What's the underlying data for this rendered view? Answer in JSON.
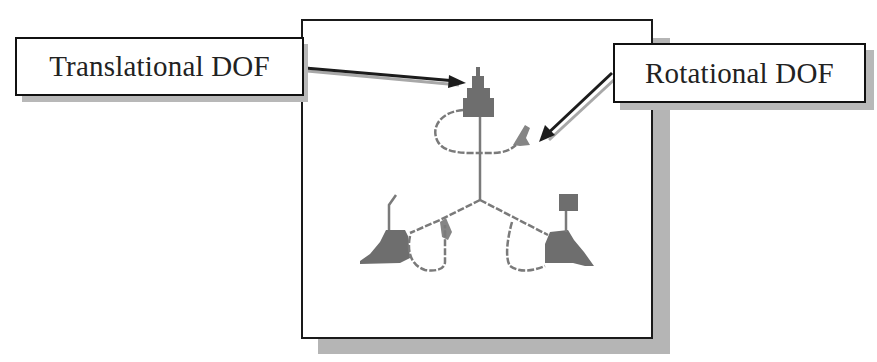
{
  "figure": {
    "callouts": [
      {
        "id": "translational",
        "label": "Translational DOF"
      },
      {
        "id": "rotational",
        "label": "Rotational DOF"
      }
    ],
    "colors": {
      "frame_border": "#1a1a1a",
      "shadow": "#b5b5b5",
      "triad_fill": "#6e6e6e",
      "triad_line": "#7a7a7a",
      "arrow": "#1c1c1c",
      "arrow_shadow": "#a8a8a8"
    }
  }
}
